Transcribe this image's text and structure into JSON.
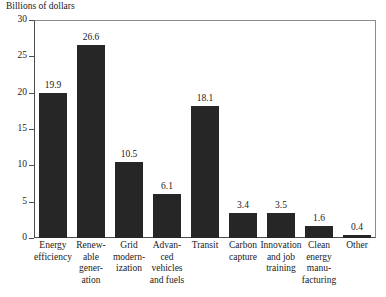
{
  "chart_data": {
    "type": "bar",
    "title": "Billions of dollars",
    "xlabel": "",
    "ylabel": "Billions of dollars",
    "ylim": [
      0,
      30
    ],
    "yticks": [
      0,
      5,
      10,
      15,
      20,
      25,
      30
    ],
    "ytick_labels": [
      "0",
      "5",
      "10",
      "15",
      "20",
      "25",
      "30"
    ],
    "grid": false,
    "legend": false,
    "bar_color": "#262626",
    "categories": [
      "Energy\nefficiency",
      "Renew-\nable\ngener-\nation",
      "Grid\nmodern-\nization",
      "Advan-\nced\nvehicles\nand fuels",
      "Transit",
      "Carbon\ncapture",
      "Innovation\nand job\ntraining",
      "Clean\nenergy\nmanu-\nfacturing",
      "Other"
    ],
    "values": [
      19.9,
      26.6,
      10.5,
      6.1,
      18.1,
      3.4,
      3.5,
      1.6,
      0.4
    ],
    "value_labels": [
      "19.9",
      "26.6",
      "10.5",
      "6.1",
      "18.1",
      "3.4",
      "3.5",
      "1.6",
      "0.4"
    ]
  }
}
